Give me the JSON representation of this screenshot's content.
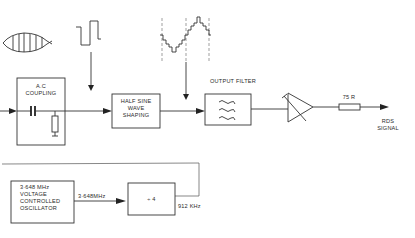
{
  "diagram": {
    "blocks": {
      "ac_coupling": {
        "label_line1": "A.C",
        "label_line2": "COUPLING"
      },
      "half_sine": {
        "label_line1": "HALF SINE",
        "label_line2": "WAVE",
        "label_line3": "SHAPING"
      },
      "output_filter": {
        "label": "OUTPUT FILTER"
      },
      "vco": {
        "label_line1": "3·648 MHz",
        "label_line2": "VOLTAGE",
        "label_line3": "CONTROLLED",
        "label_line4": "OSCILLATOR"
      },
      "divider": {
        "label": "÷ 4"
      }
    },
    "labels": {
      "resistor": "75 R",
      "output_line1": "RDS",
      "output_line2": "SIGNAL",
      "vco_output_freq": "3·648MHz",
      "divider_output_freq": "912 KHz"
    },
    "waveforms": [
      "modulated-envelope",
      "square-wave",
      "stepped-sine"
    ],
    "colors": {
      "ink": "#333333",
      "background": "#ffffff"
    }
  }
}
